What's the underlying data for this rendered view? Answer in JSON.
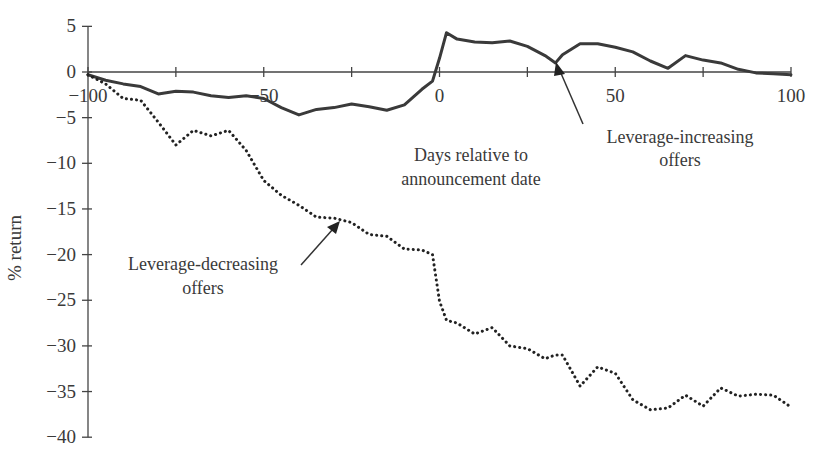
{
  "chart_data": {
    "type": "line",
    "title": "",
    "xlabel": "Days relative to announcement date",
    "ylabel": "% return",
    "xlim": [
      -100,
      100
    ],
    "ylim": [
      -40,
      5
    ],
    "x_ticks": [
      -100,
      -75,
      -50,
      -25,
      0,
      25,
      50,
      75,
      100
    ],
    "x_tick_labels": [
      "-100",
      "",
      "-50",
      "",
      "0",
      "",
      "50",
      "",
      "100"
    ],
    "y_ticks": [
      5,
      0,
      -5,
      -10,
      -15,
      -20,
      -25,
      -30,
      -35,
      -40
    ],
    "y_tick_labels": [
      "5",
      "0",
      "-5",
      "-10",
      "-15",
      "-20",
      "-25",
      "-30",
      "-35",
      "-40"
    ],
    "grid": false,
    "legend": "none (inline annotations with arrows)",
    "annotations": [
      {
        "text": "Leverage-increasing offers",
        "points_to": {
          "x": 33,
          "y": 1
        }
      },
      {
        "text": "Leverage-decreasing offers",
        "points_to": {
          "x": -56,
          "y": -16
        }
      },
      {
        "text": "Days relative to announcement date",
        "position": "below x-axis, right of 0"
      }
    ],
    "x": [
      -100,
      -95,
      -90,
      -85,
      -80,
      -75,
      -70,
      -65,
      -60,
      -55,
      -50,
      -45,
      -40,
      -35,
      -30,
      -25,
      -20,
      -15,
      -10,
      -5,
      -2,
      0,
      2,
      5,
      10,
      15,
      20,
      25,
      30,
      33,
      35,
      40,
      45,
      50,
      55,
      60,
      65,
      70,
      75,
      80,
      85,
      90,
      95,
      100
    ],
    "series": [
      {
        "name": "Leverage-increasing offers",
        "style": "solid",
        "values": [
          -0.3,
          -0.9,
          -1.3,
          -1.6,
          -2.4,
          -2.1,
          -2.2,
          -2.6,
          -2.8,
          -2.6,
          -2.9,
          -3.9,
          -4.7,
          -4.1,
          -3.9,
          -3.5,
          -3.8,
          -4.2,
          -3.6,
          -1.9,
          -1.0,
          1.5,
          4.3,
          3.6,
          3.3,
          3.2,
          3.4,
          2.8,
          1.8,
          1.0,
          1.9,
          3.1,
          3.1,
          2.7,
          2.2,
          1.2,
          0.4,
          1.8,
          1.3,
          1.0,
          0.3,
          -0.1,
          -0.2,
          -0.3
        ]
      },
      {
        "name": "Leverage-decreasing offers",
        "style": "dotted",
        "values": [
          -0.3,
          -1.3,
          -2.9,
          -3.1,
          -5.5,
          -8.0,
          -6.4,
          -7.0,
          -6.4,
          -8.6,
          -11.9,
          -13.5,
          -14.6,
          -15.9,
          -16.0,
          -16.5,
          -17.8,
          -18.0,
          -19.4,
          -19.5,
          -20.0,
          -25.1,
          -27.2,
          -27.5,
          -28.7,
          -28.0,
          -30.0,
          -30.3,
          -31.4,
          -31.0,
          -31.0,
          -34.4,
          -32.3,
          -33.0,
          -35.9,
          -37.0,
          -36.8,
          -35.4,
          -36.6,
          -34.6,
          -35.5,
          -35.3,
          -35.4,
          -36.7
        ]
      }
    ]
  }
}
